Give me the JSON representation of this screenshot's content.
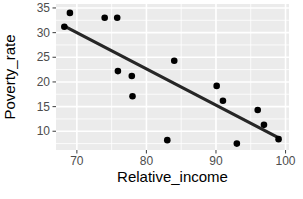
{
  "chart_data": {
    "type": "scatter",
    "title": "",
    "xlabel": "Relative_income",
    "ylabel": "Poverty_rate",
    "xlim": [
      67.0,
      100.5
    ],
    "ylim": [
      6.2,
      35.8
    ],
    "xticks": [
      70,
      80,
      90,
      100
    ],
    "yticks": [
      10,
      15,
      20,
      25,
      30,
      35
    ],
    "xtick_labels": [
      "70",
      "80",
      "90",
      "100"
    ],
    "ytick_labels": [
      "10",
      "15",
      "20",
      "25",
      "30",
      "35"
    ],
    "grid": true,
    "legend": "none",
    "point_color": "#000000",
    "line_color": "#262626",
    "panel_color": "#ebebeb",
    "grid_color": "#ffffff",
    "points": [
      {
        "x": 68.2,
        "y": 31.2
      },
      {
        "x": 69.0,
        "y": 34.0
      },
      {
        "x": 74.0,
        "y": 33.0
      },
      {
        "x": 75.8,
        "y": 33.0
      },
      {
        "x": 75.9,
        "y": 22.2
      },
      {
        "x": 77.9,
        "y": 21.2
      },
      {
        "x": 78.0,
        "y": 17.1
      },
      {
        "x": 83.0,
        "y": 8.2
      },
      {
        "x": 84.0,
        "y": 24.3
      },
      {
        "x": 90.1,
        "y": 19.2
      },
      {
        "x": 91.0,
        "y": 16.2
      },
      {
        "x": 93.0,
        "y": 7.5
      },
      {
        "x": 96.0,
        "y": 14.3
      },
      {
        "x": 96.9,
        "y": 11.3
      },
      {
        "x": 99.0,
        "y": 8.4
      }
    ],
    "trend_line": {
      "x0": 68.2,
      "y0": 31.3,
      "x1": 99.1,
      "y1": 8.6
    }
  }
}
